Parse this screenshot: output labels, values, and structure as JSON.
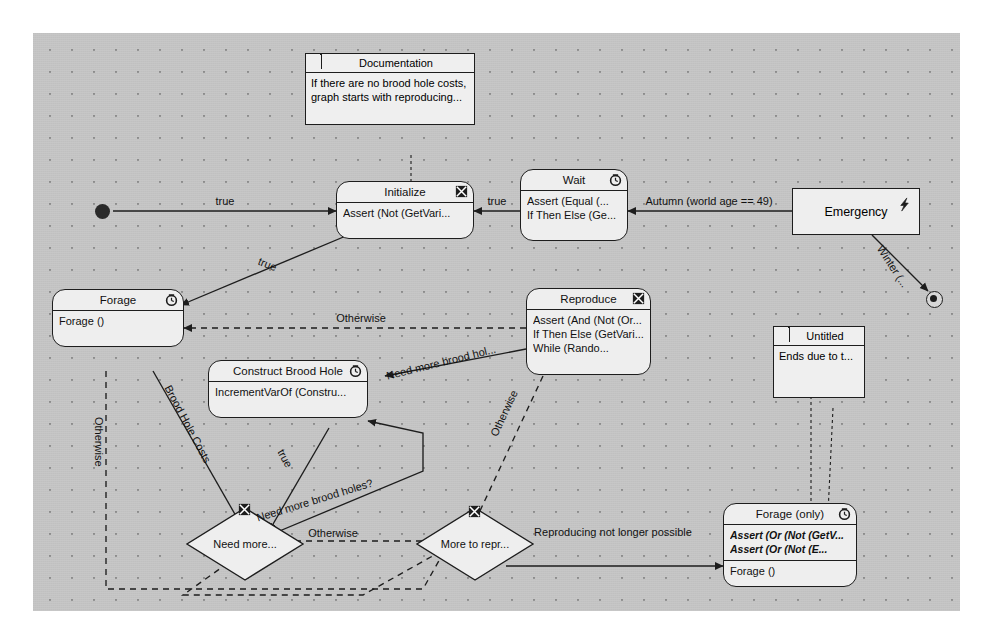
{
  "diagram": {
    "canvas": {
      "bg": "#c3c3c3",
      "grid_dot": "#8d8d8d",
      "node_fill": "#eeeeee",
      "stroke": "#1d1d1d"
    }
  },
  "notes": [
    {
      "name": "documentation-note",
      "title": "Documentation",
      "lines": [
        "If there are no brood hole costs,",
        "graph starts with reproducing..."
      ]
    },
    {
      "name": "untitled-note",
      "title": "Untitled",
      "lines": [
        "Ends due to  t..."
      ]
    }
  ],
  "nodes": [
    {
      "id": "initialize",
      "title": "Initialize",
      "icon": "crossed-box-icon",
      "lines": [
        "Assert (Not (GetVari..."
      ],
      "lines2": []
    },
    {
      "id": "wait",
      "title": "Wait",
      "icon": "clock-icon",
      "lines": [
        "Assert (Equal (...",
        "If Then Else (Ge..."
      ],
      "lines2": []
    },
    {
      "id": "emergency",
      "title": "Emergency",
      "icon": "lightning-icon",
      "lines": [],
      "lines2": []
    },
    {
      "id": "forage",
      "title": "Forage",
      "icon": "clock-icon",
      "lines": [
        "Forage ()"
      ],
      "lines2": []
    },
    {
      "id": "reproduce",
      "title": "Reproduce",
      "icon": "crossed-box-icon",
      "lines": [
        "Assert (And (Not (Or...",
        "If Then Else (GetVari...",
        "While (Rando..."
      ],
      "lines2": []
    },
    {
      "id": "construct-brood-hole",
      "title": "Construct Brood Hole",
      "icon": "clock-icon",
      "lines": [
        "IncrementVarOf (Constru..."
      ],
      "lines2": []
    },
    {
      "id": "forage-only",
      "title": "Forage (only)",
      "icon": "clock-icon",
      "lines": [
        "Assert (Or (Not (GetV...",
        "Assert (Or (Not (E..."
      ],
      "lines2": [
        "Forage ()"
      ]
    }
  ],
  "decisions": [
    {
      "id": "need-more",
      "label": "Need more...",
      "icon": "crossed-box-icon"
    },
    {
      "id": "more-to-repr",
      "label": "More to repr...",
      "icon": "crossed-box-icon"
    }
  ],
  "pseudostates": [
    {
      "id": "initial-state",
      "kind": "initial"
    },
    {
      "id": "final-state",
      "kind": "final"
    }
  ],
  "edge_labels": [
    {
      "id": "l-true-1",
      "text": "true"
    },
    {
      "id": "l-true-2",
      "text": "true"
    },
    {
      "id": "l-true-3",
      "text": "true"
    },
    {
      "id": "l-autumn",
      "text": "Autumn (world age == 49)"
    },
    {
      "id": "l-winter",
      "text": "Winter (..."
    },
    {
      "id": "l-otherwise-1",
      "text": "Otherwise"
    },
    {
      "id": "l-otherwise-2",
      "text": "Otherwise"
    },
    {
      "id": "l-otherwise-3",
      "text": "Otherwise"
    },
    {
      "id": "l-otherwise-4",
      "text": "Otherwise"
    },
    {
      "id": "l-brood-costs",
      "text": "Brood Hole Costs"
    },
    {
      "id": "l-true-4",
      "text": "true"
    },
    {
      "id": "l-need-hol",
      "text": "Need more brood hol..."
    },
    {
      "id": "l-need-holes-q",
      "text": "Need more brood holes?"
    },
    {
      "id": "l-repro-no",
      "text": "Reproducing not longer possible"
    }
  ]
}
